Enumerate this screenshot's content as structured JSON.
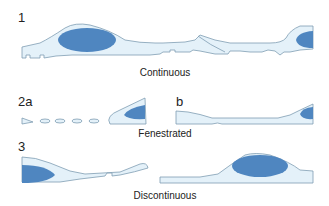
{
  "colors": {
    "cytoplasm": "#e4f1f9",
    "outline": "#7f9db3",
    "nucleus": "#4f86c0"
  },
  "panels": [
    {
      "id": "1",
      "label": "1",
      "caption": "Continuous"
    },
    {
      "id": "2a",
      "label": "2a",
      "sublabel": "b",
      "caption": "Fenestrated"
    },
    {
      "id": "3",
      "label": "3",
      "caption": "Discontinuous"
    }
  ]
}
